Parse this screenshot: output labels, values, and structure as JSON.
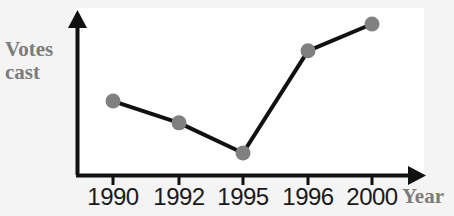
{
  "chart_data": {
    "type": "line",
    "title": "",
    "subtitle": "",
    "xlabel": "Year",
    "ylabel": "Votes cast",
    "categories": [
      "1990",
      "1992",
      "1995",
      "1996",
      "2000"
    ],
    "series": [
      {
        "name": "Votes cast",
        "values": [
          44,
          31,
          13,
          74,
          90
        ],
        "marker": "circle",
        "marker_color": "#808080",
        "line_color": "#111111"
      }
    ],
    "ylim": [
      0,
      100
    ],
    "y_ticks": [],
    "y_tick_labels": [],
    "x_ticks": [
      "1990",
      "1992",
      "1995",
      "1996",
      "2000"
    ],
    "grid": false,
    "legend": false,
    "legend_position": "none",
    "axis_style": "arrow",
    "axis_color": "#111111",
    "annotations": []
  },
  "labels": {
    "y_axis_line1": "Votes",
    "y_axis_line2": "cast",
    "x_axis_title": "Year",
    "ticks": [
      "1990",
      "1992",
      "1995",
      "1996",
      "2000"
    ]
  },
  "colors": {
    "background": "#f4f4f4",
    "plot_background": "#ffffff",
    "axis": "#111111",
    "marker": "#808080",
    "line": "#111111",
    "axis_title_text": "#7c7c7c",
    "tick_text": "#1a1a1a"
  },
  "icons": {
    "y_axis_arrow": "arrow-up-icon",
    "x_axis_arrow": "arrow-right-icon"
  }
}
